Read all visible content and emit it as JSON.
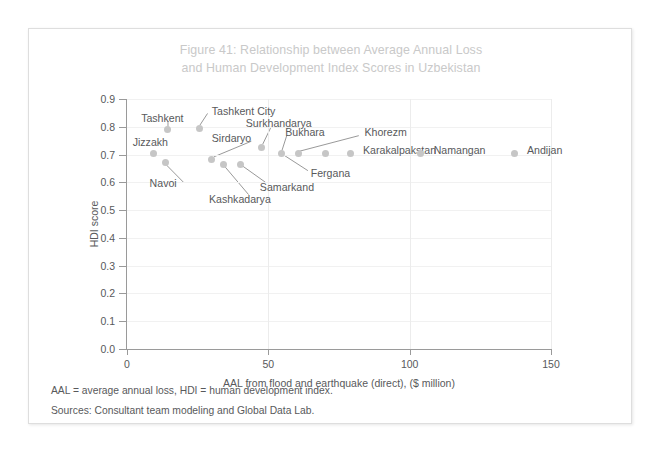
{
  "figure": {
    "title_line1": "Figure 41: Relationship between Average Annual Loss",
    "title_line2": "and Human Development Index Scores in Uzbekistan",
    "note_abbrev": "AAL = average annual loss, HDI = human development index.",
    "note_sources": "Sources: Consultant team modeling and Global Data Lab.",
    "title_color": "#c9c9c9",
    "dot_color": "#c6c6c6",
    "text_color": "#58595b"
  },
  "chart_data": {
    "type": "scatter",
    "title": "Figure 41: Relationship between Average Annual Loss and Human Development Index Scores in Uzbekistan",
    "xlabel": "AAL from flood and earthquake (direct), ($ million)",
    "ylabel": "HDI score",
    "xlim": [
      0,
      150
    ],
    "ylim": [
      0.0,
      0.9
    ],
    "xticks": [
      0,
      50,
      100,
      150
    ],
    "xtick_labels": [
      "0",
      "50",
      "100",
      "150"
    ],
    "yticks": [
      0.0,
      0.1,
      0.2,
      0.3,
      0.4,
      0.5,
      0.6,
      0.7,
      0.8,
      0.9
    ],
    "ytick_labels": [
      "0.0",
      "0.1",
      "0.2",
      "0.3",
      "0.4",
      "0.5",
      "0.6",
      "0.7",
      "0.8",
      "0.9"
    ],
    "grid": "vertical-and-horizontal-faint",
    "legend": "none",
    "points": [
      {
        "name": "Jizzakh",
        "x": 9.5,
        "y": 0.705,
        "label_x": 2.0,
        "label_y": 0.745,
        "leader": false
      },
      {
        "name": "Tashkent",
        "x": 14.5,
        "y": 0.79,
        "label_x": 5.0,
        "label_y": 0.832,
        "leader": true,
        "leader_from_x": 14.5,
        "leader_from_y": 0.82,
        "leader_to_x": 14.5,
        "leader_to_y": 0.8
      },
      {
        "name": "Navoi",
        "x": 13.5,
        "y": 0.67,
        "label_x": 8.0,
        "label_y": 0.597,
        "leader": true,
        "leader_from_x": 20.0,
        "leader_from_y": 0.6,
        "leader_to_x": 14.0,
        "leader_to_y": 0.662
      },
      {
        "name": "Tashkent City",
        "x": 25.5,
        "y": 0.795,
        "label_x": 30.0,
        "label_y": 0.858,
        "leader": true,
        "leader_from_x": 28.5,
        "leader_from_y": 0.848,
        "leader_to_x": 25.8,
        "leader_to_y": 0.806
      },
      {
        "name": "Sirdaryo",
        "x": 30.0,
        "y": 0.684,
        "label_x": 30.0,
        "label_y": 0.76,
        "leader": true,
        "leader_from_x": 44.0,
        "leader_from_y": 0.748,
        "leader_to_x": 30.8,
        "leader_to_y": 0.692
      },
      {
        "name": "Kashkadarya",
        "x": 34.0,
        "y": 0.666,
        "label_x": 29.0,
        "label_y": 0.54,
        "leader": true,
        "leader_from_x": 43.0,
        "leader_from_y": 0.556,
        "leader_to_x": 34.5,
        "leader_to_y": 0.658
      },
      {
        "name": "Samarkand",
        "x": 40.0,
        "y": 0.666,
        "label_x": 47.0,
        "label_y": 0.585,
        "leader": true,
        "leader_from_x": 49.0,
        "leader_from_y": 0.6,
        "leader_to_x": 41.0,
        "leader_to_y": 0.658
      },
      {
        "name": "Surkhandarya",
        "x": 47.7,
        "y": 0.727,
        "label_x": 42.0,
        "label_y": 0.812,
        "leader": true,
        "leader_from_x": 51.0,
        "leader_from_y": 0.8,
        "leader_to_x": 48.0,
        "leader_to_y": 0.737
      },
      {
        "name": "Bukhara",
        "x": 54.5,
        "y": 0.705,
        "label_x": 56.0,
        "label_y": 0.78,
        "leader": true,
        "leader_from_x": 56.5,
        "leader_from_y": 0.768,
        "leader_to_x": 54.8,
        "leader_to_y": 0.714
      },
      {
        "name": "Fergana",
        "x": 60.5,
        "y": 0.705,
        "label_x": 65.0,
        "label_y": 0.632,
        "leader": true,
        "leader_from_x": 64.0,
        "leader_from_y": 0.642,
        "leader_to_x": 55.5,
        "leader_to_y": 0.698
      },
      {
        "name": "Khorezm",
        "x": 70.4,
        "y": 0.705,
        "label_x": 84.0,
        "label_y": 0.78,
        "leader": true,
        "leader_from_x": 82.0,
        "leader_from_y": 0.768,
        "leader_to_x": 61.0,
        "leader_to_y": 0.712
      },
      {
        "name": "Karakalpakstan",
        "x": 79.0,
        "y": 0.705,
        "label_x": 83.5,
        "label_y": 0.718,
        "leader": false
      },
      {
        "name": "Namangan",
        "x": 104.0,
        "y": 0.705,
        "label_x": 108.5,
        "label_y": 0.718,
        "leader": false
      },
      {
        "name": "Andijan",
        "x": 137.0,
        "y": 0.705,
        "label_x": 141.5,
        "label_y": 0.718,
        "leader": false
      }
    ]
  }
}
